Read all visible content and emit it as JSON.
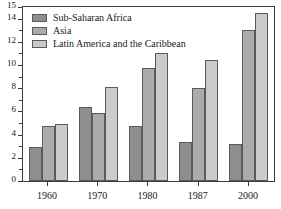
{
  "chart_data": {
    "type": "bar",
    "title": "",
    "subtitle": "",
    "xlabel": "",
    "ylabel": "",
    "categories": [
      "1960",
      "1970",
      "1980",
      "1987",
      "2000"
    ],
    "series": [
      {
        "name": "Sub-Saharan Africa",
        "color": "#8e8e8e",
        "values": [
          2.9,
          6.4,
          4.7,
          3.4,
          3.2
        ]
      },
      {
        "name": "Asia",
        "color": "#ababab",
        "values": [
          4.7,
          5.9,
          9.75,
          8.0,
          13.0
        ]
      },
      {
        "name": "Latin America and the Caribbean",
        "color": "#cbcbcb",
        "values": [
          4.9,
          8.1,
          11.05,
          10.45,
          14.5
        ]
      }
    ],
    "ylim": [
      0,
      15
    ],
    "y_ticks": [
      0,
      2,
      4,
      6,
      8,
      10,
      12,
      14,
      15
    ],
    "y_tick_labels": [
      "0",
      "2",
      "4",
      "6",
      "8",
      "10",
      "12",
      "14",
      "15"
    ],
    "y_minor_ticks": [
      1,
      3,
      5,
      7,
      9,
      11,
      13
    ],
    "grid": false,
    "legend_position": "top-left",
    "frame": true
  },
  "legend": {
    "entries": [
      {
        "label": "Sub-Saharan Africa"
      },
      {
        "label": "Asia"
      },
      {
        "label": "Latin America and the Caribbean"
      }
    ]
  },
  "axes": {
    "y_labels": [
      "15",
      "14",
      "12",
      "10",
      "8",
      "6",
      "4",
      "2",
      "0"
    ],
    "x_labels": [
      "1960",
      "1970",
      "1980",
      "1987",
      "2000"
    ]
  }
}
